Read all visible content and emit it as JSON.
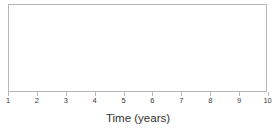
{
  "chart_data": {
    "type": "line",
    "title": "",
    "subtitle": "",
    "xlabel": "Time (years)",
    "ylabel": "",
    "xticks": [
      1,
      2,
      3,
      4,
      5,
      6,
      7,
      8,
      9,
      10
    ],
    "xticklabels": [
      "1",
      "2",
      "3",
      "4",
      "5",
      "6",
      "7",
      "8",
      "9",
      "10"
    ],
    "yticks": [],
    "yticklabels": [],
    "xlim": [
      1,
      10
    ],
    "ylim": [
      0,
      1
    ],
    "grid": false,
    "legend": false,
    "legend_position": "none",
    "series": [],
    "annotations": [],
    "note": "Empty plot frame: no data series, gridlines, legend, or y-axis labels are drawn."
  },
  "figure": {
    "frame_color": "#b7b7b7",
    "background_color": "#ffffff",
    "tick_color": "#b7b7b7",
    "tick_label_color": "#3a3a3a",
    "axis_title_color": "#333333"
  }
}
